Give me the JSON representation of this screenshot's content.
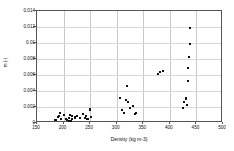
{
  "chart_data": {
    "type": "scatter",
    "title": "",
    "xlabel": "Density (kg m-3)",
    "ylabel": "m (-)",
    "xlim": [
      150,
      500
    ],
    "ylim": [
      0,
      0.014
    ],
    "xticks": [
      150,
      200,
      250,
      300,
      350,
      400,
      450,
      500
    ],
    "xtick_labels": [
      "150",
      "200",
      "250",
      "300",
      "350",
      "400",
      "450",
      "500"
    ],
    "yticks": [
      0,
      0.002,
      0.004,
      0.006,
      0.008,
      0.01,
      0.012,
      0.014
    ],
    "ytick_labels": [
      "0",
      "0.002",
      "0.004",
      "0.006",
      "0.008",
      "0.01",
      "0.012",
      "0.014"
    ],
    "grid": true,
    "legend": false,
    "marker": "square",
    "marker_color": "#111111",
    "series": [
      {
        "name": "samples",
        "x": [
          184,
          186,
          190,
          191,
          194,
          196,
          200,
          205,
          207,
          210,
          211,
          212,
          213,
          214,
          215,
          216,
          221,
          222,
          226,
          231,
          236,
          241,
          243,
          245,
          246,
          249,
          250,
          251,
          307,
          310,
          313,
          318,
          320,
          322,
          325,
          330,
          334,
          336,
          378,
          381,
          388,
          424,
          427,
          430,
          431,
          432,
          433,
          434,
          435,
          436,
          437,
          438
        ],
        "y": [
          0.00035,
          0.0004,
          0.0007,
          0.00085,
          0.0012,
          0.00055,
          0.00095,
          0.00045,
          0.00035,
          0.00025,
          0.00065,
          0.00095,
          0.00025,
          0.0002,
          0.00055,
          0.00085,
          0.0008,
          0.0006,
          0.00085,
          0.00065,
          0.0011,
          0.0006,
          0.0009,
          0.00055,
          0.00055,
          0.0018,
          0.0016,
          0.0007,
          0.0031,
          0.0016,
          0.0012,
          0.0029,
          0.0046,
          0.0026,
          0.0019,
          0.0021,
          0.0011,
          0.0012,
          0.0061,
          0.0064,
          0.0065,
          0.0019,
          0.0026,
          0.0031,
          0.003,
          0.0022,
          0.0022,
          0.0053,
          0.0069,
          0.0083,
          0.0099,
          0.0119
        ]
      }
    ]
  }
}
